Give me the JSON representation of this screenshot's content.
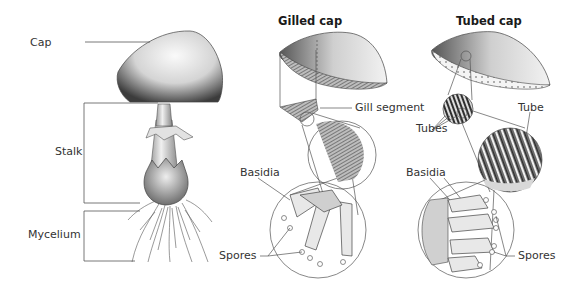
{
  "diagram": {
    "colors": {
      "line": "#555555",
      "text": "#333333",
      "title": "#1a1a1a",
      "illustration_dark": "#3a3a3a",
      "illustration_light": "#e6e6e6"
    },
    "whole_mushroom": {
      "labels": {
        "cap": "Cap",
        "stalk": "Stalk",
        "mycelium": "Mycelium"
      }
    },
    "gilled_cap": {
      "title": "Gilled cap",
      "labels": {
        "gill_segment": "Gill segment",
        "basidia": "Basidia",
        "spores": "Spores"
      }
    },
    "tubed_cap": {
      "title": "Tubed cap",
      "labels": {
        "tubes": "Tubes",
        "tube": "Tube",
        "basidia": "Basidia",
        "spores": "Spores"
      }
    }
  }
}
